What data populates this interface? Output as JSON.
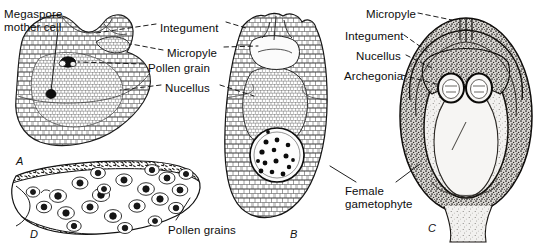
{
  "figure": {
    "kind": "botanical-line-drawing",
    "background_color": "#ffffff",
    "ink_color": "#111111"
  },
  "labels": [
    {
      "id": "megaspore-mother-cell",
      "text": "Megaspore\nmother cell",
      "x": 4,
      "y": 8,
      "align": "left"
    },
    {
      "id": "integument-left",
      "text": "Integument",
      "x": 160,
      "y": 22,
      "align": "left"
    },
    {
      "id": "micropyle-left",
      "text": "Micropyle",
      "x": 167,
      "y": 47,
      "align": "left"
    },
    {
      "id": "pollen-grain",
      "text": "Pollen grain",
      "x": 148,
      "y": 62,
      "align": "left"
    },
    {
      "id": "nucellus-left",
      "text": "Nucellus",
      "x": 165,
      "y": 82,
      "align": "left"
    },
    {
      "id": "pollen-grains",
      "text": "Pollen grains",
      "x": 168,
      "y": 224,
      "align": "left"
    },
    {
      "id": "female-gametophyte",
      "text": "Female\ngametophyte",
      "x": 345,
      "y": 185,
      "align": "left"
    },
    {
      "id": "micropyle-right",
      "text": "Micropyle",
      "x": 366,
      "y": 8,
      "align": "left"
    },
    {
      "id": "integument-right",
      "text": "Integument",
      "x": 345,
      "y": 30,
      "align": "left"
    },
    {
      "id": "nucellus-right",
      "text": "Nucellus",
      "x": 356,
      "y": 50,
      "align": "left"
    },
    {
      "id": "archegonia",
      "text": "Archegonia",
      "x": 344,
      "y": 70,
      "align": "left"
    }
  ],
  "panels": [
    {
      "id": "A",
      "letter": "A",
      "x": 16,
      "y": 155,
      "caption": "young ovule with megaspore mother cell"
    },
    {
      "id": "B",
      "letter": "B",
      "x": 290,
      "y": 228,
      "caption": "ovule with free-nuclear female gametophyte"
    },
    {
      "id": "C",
      "letter": "C",
      "x": 428,
      "y": 222,
      "caption": "mature seed with archegonia"
    },
    {
      "id": "D",
      "letter": "D",
      "x": 30,
      "y": 228,
      "caption": "pollen chamber with pollen grains"
    }
  ],
  "chart_data": {
    "type": "diagram",
    "panel_count": 4,
    "panel_ids": [
      "A",
      "B",
      "C",
      "D"
    ],
    "structures_labeled": [
      "Megaspore mother cell",
      "Integument",
      "Micropyle",
      "Pollen grain",
      "Nucellus",
      "Pollen grains",
      "Female gametophyte",
      "Archegonia"
    ],
    "counts": {
      "pollen_grains_in_panel_D": 22,
      "free_nuclei_in_panel_B_gametophyte": 15,
      "archegonia_in_panel_C": 2
    }
  }
}
